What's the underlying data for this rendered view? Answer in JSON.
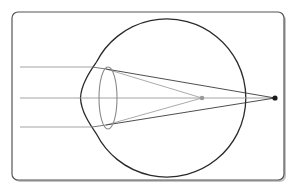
{
  "diagram": {
    "title": "",
    "colors": {
      "background": "#ffffff",
      "frame_stroke": "#555555",
      "frame_shadow": "#b8b8b8",
      "eye_outline": "#2a2a2a",
      "lens_outline": "#8a8a8a",
      "ray_gray": "#9a9a9a",
      "ray_dark": "#3a3a3a",
      "focal_point_inner": "#999999",
      "focal_point_outer": "#1a1a1a"
    },
    "elements": {
      "frame": {
        "x": 12,
        "y": 12,
        "width": 272,
        "height": 168,
        "radius": 6
      },
      "eyeball": {
        "cx": 163,
        "cy": 98,
        "r": 79
      },
      "lens": {
        "cx": 108,
        "cy": 98,
        "rx": 9,
        "ry": 31
      },
      "incoming_rays_y": [
        67,
        98,
        127
      ],
      "ray_start_x": 20,
      "focal_point_inner": {
        "x": 202,
        "y": 98,
        "label": ""
      },
      "focal_point_outer": {
        "x": 275,
        "y": 98,
        "label": ""
      }
    },
    "labels": []
  }
}
